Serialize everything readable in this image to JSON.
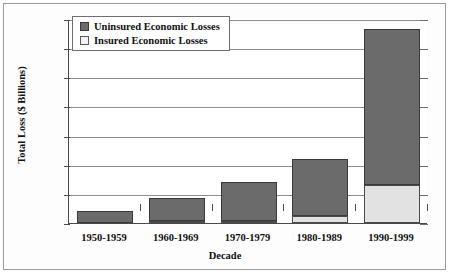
{
  "chart_data": {
    "type": "bar",
    "subtype": "stacked-vertical",
    "title": "",
    "xlabel": "Decade",
    "ylabel": "Total Loss ($ Billions)",
    "categories": [
      "1950-1959",
      "1960-1969",
      "1970-1979",
      "1980-1989",
      "1990-1999"
    ],
    "series": [
      {
        "name": "Insured Economic Losses",
        "values": [
          0,
          3,
          5,
          25,
          130
        ],
        "color": "#e2e2e2"
      },
      {
        "name": "Uninsured Economic Losses",
        "values": [
          42,
          78,
          135,
          195,
          535
        ],
        "color": "#6b6b6b"
      }
    ],
    "totals": [
      42,
      81,
      140,
      220,
      665
    ],
    "ylim": [
      0,
      700
    ],
    "ytick_values": [
      0,
      100,
      200,
      300,
      400,
      500,
      600,
      700
    ],
    "ytick_labels": [
      "$0",
      "$100",
      "$200",
      "$300",
      "$400",
      "$500",
      "$600",
      "$700"
    ],
    "grid": "horizontal",
    "legend_position": "top-left-inside",
    "legend_entries": [
      "Uninsured Economic Losses",
      "Insured Economic Losses"
    ]
  },
  "axes": {
    "y_title": "Total Loss ($ Billions)",
    "x_title": "Decade"
  }
}
